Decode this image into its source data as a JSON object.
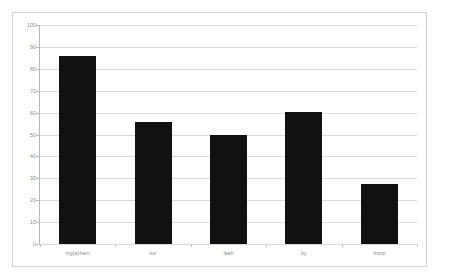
{
  "chart_data": {
    "type": "bar",
    "title": "",
    "xlabel": "",
    "ylabel": "",
    "categories": [
      "ing(a)ham",
      "tun",
      "leah",
      "by",
      "thorp"
    ],
    "values": [
      86,
      55.5,
      50,
      60.5,
      27.5
    ],
    "ylim": [
      0,
      100
    ],
    "yticks": [
      0,
      10,
      20,
      30,
      40,
      50,
      60,
      70,
      80,
      90,
      100
    ],
    "ytick_labels": [
      "0",
      "10",
      "20",
      "30",
      "40",
      "50",
      "60",
      "70",
      "80",
      "90",
      "100"
    ],
    "grid": true,
    "legend": false,
    "bar_color": "#111111",
    "gridline_color": "#d9d9d9",
    "axis_color": "#b8b8b8",
    "frame_color": "#d2d2d2",
    "background_color": "#ffffff",
    "tick_label_color": "#888888"
  }
}
